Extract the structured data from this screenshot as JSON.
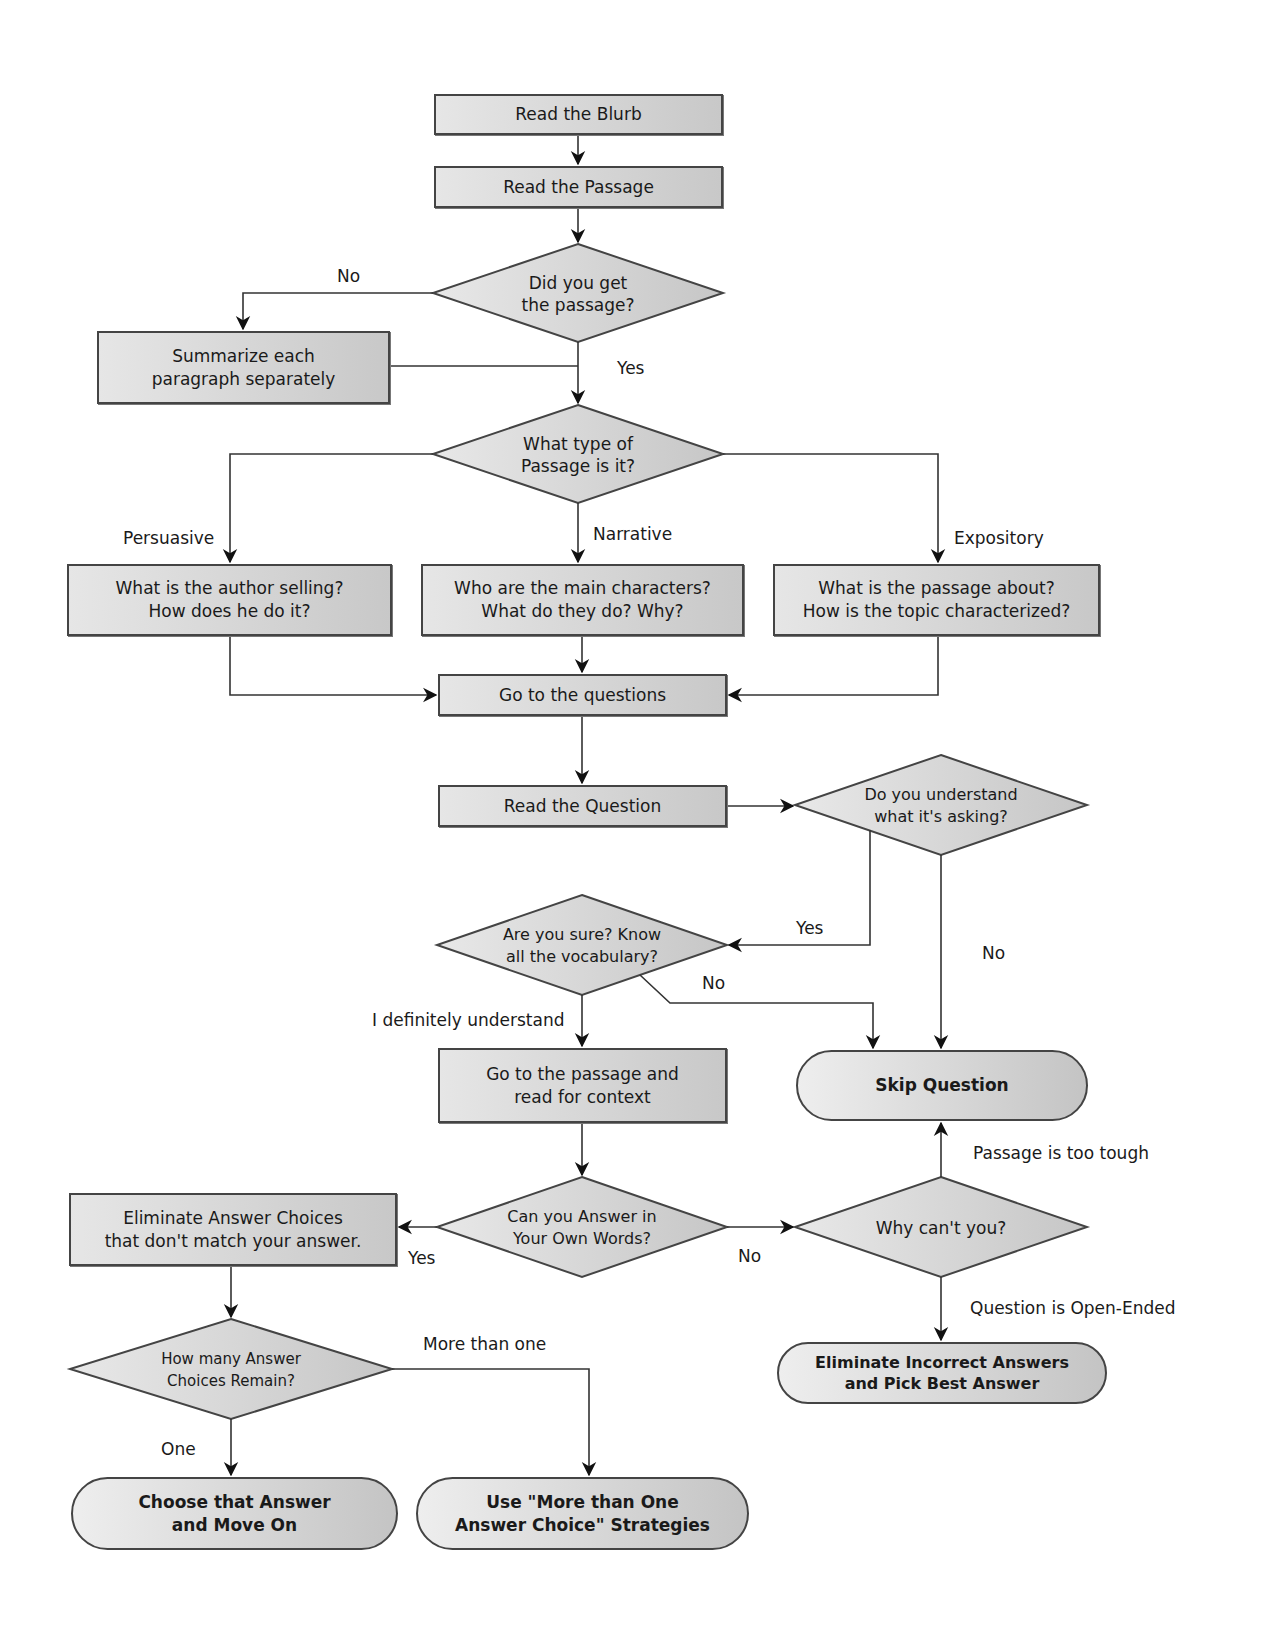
{
  "colors": {
    "node_fill_light": "#e6e6e6",
    "node_fill_dark": "#c8c8c8",
    "stroke": "#444444",
    "background": "#ffffff"
  },
  "nodes": {
    "read_blurb": "Read the Blurb",
    "read_passage": "Read the Passage",
    "did_you_get": "Did you get\nthe passage?",
    "summarize": "Summarize each\nparagraph separately",
    "what_type": "What type of\nPassage is it?",
    "persuasive_box": "What is the author selling?\nHow does he do it?",
    "narrative_box": "Who are the main characters?\nWhat do they do? Why?",
    "expository_box": "What is the passage about?\nHow is the topic characterized?",
    "go_questions": "Go to the questions",
    "read_question": "Read the Question",
    "do_you_understand": "Do you understand\nwhat it's asking?",
    "are_you_sure": "Are you sure?  Know\nall the vocabulary?",
    "go_passage": "Go to the passage and\nread for context",
    "skip_question": "Skip Question",
    "can_you_answer": "Can you Answer in\nYour Own Words?",
    "why_cant": "Why can't you?",
    "eliminate_choices": "Eliminate Answer Choices\nthat don't match your answer.",
    "how_many": "How many Answer\nChoices Remain?",
    "eliminate_incorrect": "Eliminate Incorrect Answers\nand Pick Best Answer",
    "choose_answer": "Choose that Answer\nand Move On",
    "use_strategies": "Use \"More than One\nAnswer Choice\" Strategies"
  },
  "edge_labels": {
    "no_1": "No",
    "yes_1": "Yes",
    "persuasive": "Persuasive",
    "narrative": "Narrative",
    "expository": "Expository",
    "yes_2": "Yes",
    "no_2": "No",
    "no_3": "No",
    "definitely": "I definitely understand",
    "passage_tough": "Passage is too tough",
    "yes_3": "Yes",
    "no_4": "No",
    "open_ended": "Question is Open-Ended",
    "more_than_one": "More than one",
    "one": "One"
  }
}
